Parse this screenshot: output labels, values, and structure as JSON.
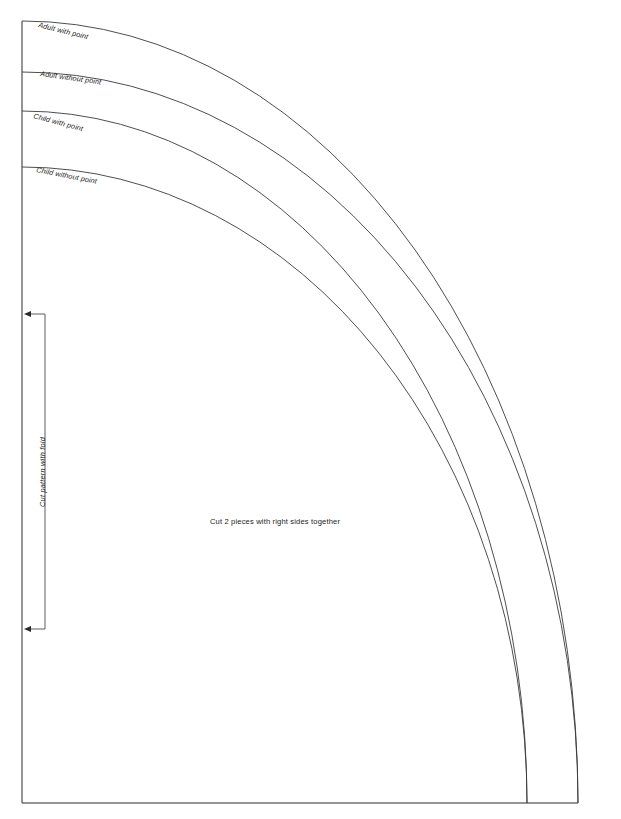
{
  "sheet": {
    "width": 621,
    "height": 819,
    "background": "#ffffff",
    "line_color": "#2b2b2b",
    "ink_color": "#1d1d1d"
  },
  "frame": {
    "fold_edge_name": "fold-edge-line",
    "bottom_edge_name": "bottom-edge-line",
    "origin_x": 22,
    "top_y": 21,
    "bottom_y": 803,
    "right_x": 578
  },
  "curves": [
    {
      "id": "adult-with-point",
      "label": "Adult with point",
      "start_y": 21,
      "end_x": 578,
      "label_x": 38,
      "label_y": 27,
      "label_rotation": 14
    },
    {
      "id": "adult-without-point",
      "label": "Adult without point",
      "start_y": 72,
      "end_x": 578,
      "label_x": 40,
      "label_y": 76,
      "label_rotation": 8
    },
    {
      "id": "child-with-point",
      "label": "Child with point",
      "start_y": 111,
      "end_x": 527,
      "label_x": 33,
      "label_y": 118,
      "label_rotation": 15
    },
    {
      "id": "child-without-point",
      "label": "Child without point",
      "start_y": 167,
      "end_x": 527,
      "label_x": 36,
      "label_y": 172,
      "label_rotation": 11
    }
  ],
  "fold_marker": {
    "label": "Cut pattern with fold",
    "top_y": 314,
    "bottom_y": 629,
    "stem_x": 45,
    "arrow_tip_x": 24,
    "label_x": 45,
    "label_y": 472
  },
  "center_note": {
    "text": "Cut 2 pieces with right sides together",
    "x": 275,
    "y": 524
  }
}
